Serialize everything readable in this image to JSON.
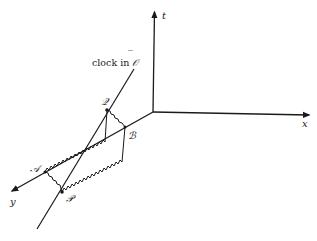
{
  "diagram": {
    "axes": {
      "t": {
        "label": "t"
      },
      "x": {
        "label": "x"
      },
      "y": {
        "label": "y"
      }
    },
    "worldline": {
      "caption_prefix": "clock in ",
      "caption_frame": "𝒪",
      "caption_bar": "‾"
    },
    "points": {
      "Q": {
        "label": "𝒬"
      },
      "B": {
        "label": "ℬ"
      },
      "A": {
        "label": "𝒜"
      },
      "P": {
        "label": "𝒫"
      }
    },
    "colors": {
      "ink": "#1a1a1a",
      "background": "#ffffff"
    }
  }
}
